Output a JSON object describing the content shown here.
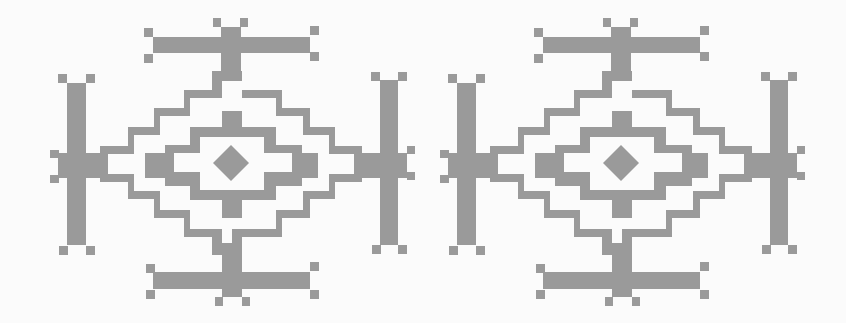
{
  "artwork": {
    "title": "",
    "motif_count": 2,
    "colors": {
      "background": "#fbfbfb",
      "motif": "#9a9a9a"
    },
    "motif_offsets_x": [
      0,
      390
    ]
  }
}
